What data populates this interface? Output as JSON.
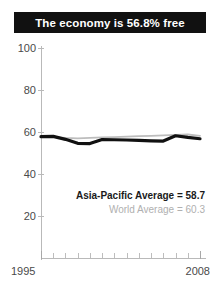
{
  "title": "The economy is 56.8% free",
  "legend": {
    "asia_pacific": "Asia-Pacific Average = 58.7",
    "world": "World Average = 60.3"
  },
  "axis": {
    "y_ticks": [
      "100",
      "80",
      "60",
      "40",
      "20"
    ],
    "x_start": "1995",
    "x_end": "2008"
  },
  "colors": {
    "title_bar": "#111111",
    "title_text": "#ffffff",
    "country_line": "#111111",
    "world_line": "#bdbdbd",
    "axis": "#b9b9b9",
    "tick_label": "#4a4a4a",
    "legend_world": "#b0b0b0"
  },
  "chart_data": {
    "type": "line",
    "title": "The economy is 56.8% free",
    "xlabel": "",
    "ylabel": "",
    "xlim": [
      1995,
      2008
    ],
    "ylim": [
      0,
      100
    ],
    "grid": false,
    "legend_position": "inside-lower-right",
    "x": [
      1995,
      1996,
      1997,
      1998,
      1999,
      2000,
      2001,
      2002,
      2003,
      2004,
      2005,
      2006,
      2007,
      2008
    ],
    "series": [
      {
        "name": "Country (economy freedom score)",
        "style": "thick-black",
        "values": [
          57.8,
          57.9,
          56.5,
          54.6,
          54.5,
          56.4,
          56.3,
          56.2,
          56.0,
          55.8,
          55.7,
          58.2,
          57.4,
          56.8
        ]
      },
      {
        "name": "World Average",
        "style": "thin-gray",
        "values": [
          58.0,
          57.6,
          57.2,
          57.0,
          57.2,
          57.4,
          57.6,
          57.8,
          58.0,
          58.2,
          58.4,
          58.6,
          58.8,
          58.2
        ]
      }
    ],
    "annotations": [
      {
        "text": "Asia-Pacific Average = 58.7",
        "value": 58.7
      },
      {
        "text": "World Average = 60.3",
        "value": 60.3
      }
    ]
  }
}
